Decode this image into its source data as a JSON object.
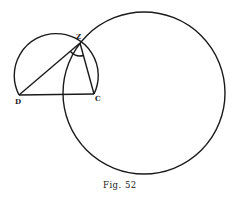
{
  "figure": {
    "caption": "Fig. 52",
    "points": {
      "D": "D",
      "C": "C",
      "Z": "Z"
    },
    "elements": [
      "large circle through Z",
      "arc of circle on chord DC through Z",
      "segment DZ",
      "segment ZC",
      "segment DC",
      "angle mark DZC"
    ],
    "ink_color": "#1a1a1a"
  }
}
